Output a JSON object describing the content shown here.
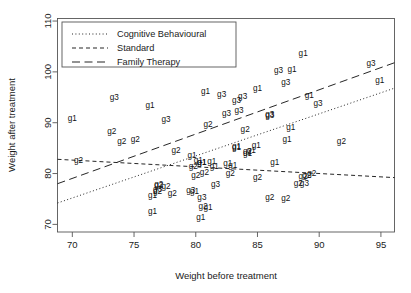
{
  "chart_data": {
    "type": "scatter",
    "title": "",
    "xlabel": "Weight before treatment",
    "ylabel": "Weight after treatment",
    "xlim": [
      68.8,
      96.1
    ],
    "ylim": [
      68.5,
      110.5
    ],
    "xticks": [
      70,
      75,
      80,
      85,
      90,
      95
    ],
    "yticks": [
      70,
      80,
      90,
      100,
      110
    ],
    "grid": false,
    "point_marker": "text-label",
    "legend_position": "top-left",
    "legend": [
      {
        "label": "Cognitive Behavioural",
        "style": "dotted",
        "group": "g1"
      },
      {
        "label": "Standard",
        "style": "dashed",
        "group": "g2"
      },
      {
        "label": "Family Therapy",
        "style": "longdash",
        "group": "g3"
      }
    ],
    "series": [
      {
        "name": "Cognitive Behavioural",
        "group_code": "g1",
        "label": "g1",
        "points": [
          {
            "x": 80.5,
            "y": 82.2
          },
          {
            "x": 84.9,
            "y": 85.6
          },
          {
            "x": 81.5,
            "y": 81.4
          },
          {
            "x": 82.6,
            "y": 81.9
          },
          {
            "x": 79.9,
            "y": 76.4
          },
          {
            "x": 88.7,
            "y": 103.6
          },
          {
            "x": 94.9,
            "y": 98.4
          },
          {
            "x": 76.3,
            "y": 93.4
          },
          {
            "x": 81.0,
            "y": 73.4
          },
          {
            "x": 80.5,
            "y": 82.1
          },
          {
            "x": 85.0,
            "y": 96.7
          },
          {
            "x": 89.2,
            "y": 95.3
          },
          {
            "x": 81.3,
            "y": 82.4
          },
          {
            "x": 76.5,
            "y": 72.5
          },
          {
            "x": 70.0,
            "y": 90.9
          },
          {
            "x": 80.4,
            "y": 71.3
          },
          {
            "x": 83.3,
            "y": 85.4
          },
          {
            "x": 83.0,
            "y": 81.6
          },
          {
            "x": 87.7,
            "y": 89.1
          },
          {
            "x": 84.2,
            "y": 83.9
          },
          {
            "x": 86.4,
            "y": 82.1
          },
          {
            "x": 76.5,
            "y": 75.7
          },
          {
            "x": 80.2,
            "y": 82.6
          },
          {
            "x": 87.8,
            "y": 100.4
          },
          {
            "x": 83.3,
            "y": 85.2
          },
          {
            "x": 79.7,
            "y": 83.6
          },
          {
            "x": 84.5,
            "y": 84.6
          },
          {
            "x": 80.8,
            "y": 96.2
          },
          {
            "x": 87.4,
            "y": 86.7
          }
        ]
      },
      {
        "name": "Standard",
        "group_code": "g2",
        "label": "g2",
        "points": [
          {
            "x": 80.7,
            "y": 80.2
          },
          {
            "x": 89.4,
            "y": 80.1
          },
          {
            "x": 91.8,
            "y": 86.4
          },
          {
            "x": 74.0,
            "y": 86.3
          },
          {
            "x": 78.1,
            "y": 76.1
          },
          {
            "x": 88.3,
            "y": 78.1
          },
          {
            "x": 87.3,
            "y": 75.1
          },
          {
            "x": 75.1,
            "y": 86.7
          },
          {
            "x": 80.6,
            "y": 73.5
          },
          {
            "x": 78.4,
            "y": 84.6
          },
          {
            "x": 77.6,
            "y": 77.4
          },
          {
            "x": 88.7,
            "y": 79.5
          },
          {
            "x": 81.0,
            "y": 89.6
          },
          {
            "x": 76.9,
            "y": 76.4
          },
          {
            "x": 84.2,
            "y": 84.4
          },
          {
            "x": 77.0,
            "y": 77.7
          },
          {
            "x": 79.8,
            "y": 81.4
          },
          {
            "x": 84.0,
            "y": 88.6
          },
          {
            "x": 70.5,
            "y": 82.5
          },
          {
            "x": 86.0,
            "y": 75.3
          },
          {
            "x": 85.0,
            "y": 79.3
          },
          {
            "x": 73.2,
            "y": 88.2
          },
          {
            "x": 82.8,
            "y": 80.0
          },
          {
            "x": 80.0,
            "y": 79.6
          },
          {
            "x": 77.0,
            "y": 77.8
          },
          {
            "x": 89.0,
            "y": 79.7
          }
        ]
      },
      {
        "name": "Family Therapy",
        "group_code": "g3",
        "label": "g3",
        "points": [
          {
            "x": 83.8,
            "y": 95.2
          },
          {
            "x": 83.3,
            "y": 94.3
          },
          {
            "x": 86.0,
            "y": 91.5
          },
          {
            "x": 82.5,
            "y": 91.9
          },
          {
            "x": 86.7,
            "y": 100.3
          },
          {
            "x": 79.6,
            "y": 76.7
          },
          {
            "x": 76.9,
            "y": 76.8
          },
          {
            "x": 94.2,
            "y": 101.6
          },
          {
            "x": 73.4,
            "y": 94.9
          },
          {
            "x": 80.5,
            "y": 75.2
          },
          {
            "x": 81.6,
            "y": 77.8
          },
          {
            "x": 82.1,
            "y": 95.5
          },
          {
            "x": 77.6,
            "y": 90.7
          },
          {
            "x": 83.5,
            "y": 92.5
          },
          {
            "x": 89.9,
            "y": 93.8
          },
          {
            "x": 86.0,
            "y": 91.7
          },
          {
            "x": 87.3,
            "y": 98.0
          },
          {
            "x": 88.8,
            "y": 78.1
          }
        ]
      }
    ],
    "fit_lines": [
      {
        "name": "Cognitive Behavioural",
        "style": "dotted",
        "x_start": 68.8,
        "y_start": 74.2,
        "x_end": 96.1,
        "y_end": 96.8
      },
      {
        "name": "Standard",
        "style": "dashed",
        "x_start": 68.8,
        "y_start": 82.8,
        "x_end": 96.1,
        "y_end": 79.2
      },
      {
        "name": "Family Therapy",
        "style": "longdash",
        "x_start": 68.8,
        "y_start": 78.0,
        "x_end": 96.1,
        "y_end": 101.8
      }
    ]
  }
}
